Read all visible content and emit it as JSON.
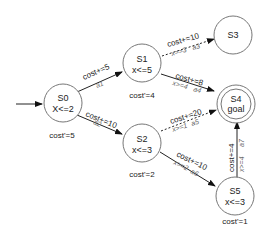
{
  "diagram": {
    "type": "priced-timed-automaton",
    "initial_arrow_target": "S0",
    "states": [
      {
        "id": "S0",
        "name": "S0",
        "invariant": "X<=2",
        "rate": "cost'=5",
        "goal": false
      },
      {
        "id": "S1",
        "name": "S1",
        "invariant": "x<=5",
        "rate": "cost'=4",
        "goal": false
      },
      {
        "id": "S2",
        "name": "S2",
        "invariant": "x<=3",
        "rate": "cost'=2",
        "goal": false
      },
      {
        "id": "S3",
        "name": "S3",
        "invariant": "",
        "rate": "",
        "goal": false
      },
      {
        "id": "S4",
        "name": "S4",
        "invariant": "goal",
        "rate": "",
        "goal": true
      },
      {
        "id": "S5",
        "name": "S5",
        "invariant": "x<=3",
        "rate": "cost'=1",
        "goal": false
      }
    ],
    "edges": [
      {
        "from": "S0",
        "to": "S1",
        "update": "cost+=5",
        "guard": "",
        "action": "a1",
        "style": "solid"
      },
      {
        "from": "S0",
        "to": "S2",
        "update": "cost+=10",
        "guard": "",
        "action": "a2",
        "style": "solid"
      },
      {
        "from": "S1",
        "to": "S3",
        "update": "cost+=10",
        "guard": "x==3",
        "action": "a3",
        "style": "dashed"
      },
      {
        "from": "S1",
        "to": "S4",
        "update": "cost+=8",
        "guard": "x>=4",
        "action": "a4",
        "style": "solid"
      },
      {
        "from": "S2",
        "to": "S4",
        "update": "cost+=20",
        "guard": "x>=1",
        "action": "a5",
        "style": "dashed"
      },
      {
        "from": "S2",
        "to": "S5",
        "update": "cost+=10",
        "guard": "x>=2",
        "action": "a6",
        "style": "solid"
      },
      {
        "from": "S5",
        "to": "S4",
        "update": "cost+=4",
        "guard": "x>=4",
        "action": "a7",
        "style": "solid"
      }
    ]
  }
}
